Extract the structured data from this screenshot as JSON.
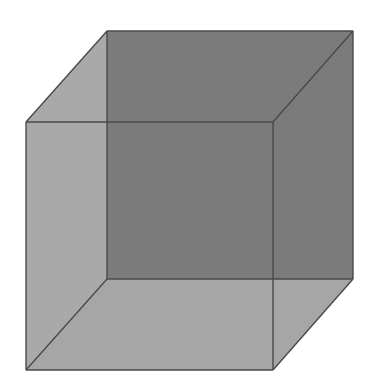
{
  "diagram": {
    "type": "transparent-cube-wireframe",
    "canvas": {
      "width": 378,
      "height": 385,
      "background": "#ffffff"
    },
    "colors": {
      "back_face": "#7b7b7b",
      "left_face": "#a9a9a9",
      "bottom_face": "#a6a6a6",
      "top_face": "#a8a8a8",
      "right_face": "#8a8a8a",
      "edge": "#4a4a4a"
    },
    "back_face": {
      "tl": [
        107,
        31
      ],
      "tr": [
        353,
        31
      ],
      "br": [
        353,
        279
      ],
      "bl": [
        107,
        279
      ]
    },
    "front_face": {
      "tl": [
        26,
        122
      ],
      "tr": [
        273,
        122
      ],
      "br": [
        273,
        370
      ],
      "bl": [
        26,
        370
      ]
    }
  }
}
